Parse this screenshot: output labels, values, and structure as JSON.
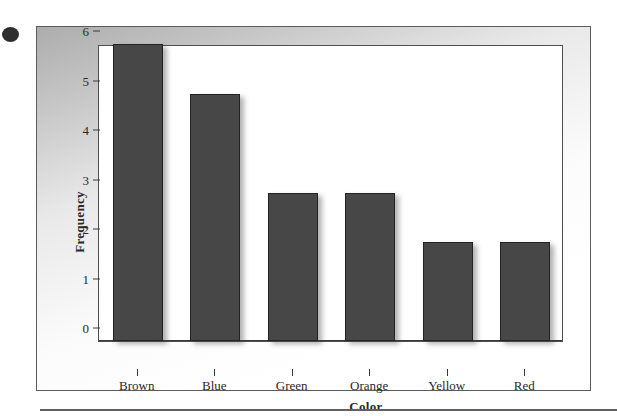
{
  "artifacts": {
    "scan_dot": "scan-dot-artifact",
    "bottom_rule": "horizontal-rule"
  },
  "colors": {
    "bar_fill": "#474747",
    "bar_outline": "#232323",
    "axis": "#3a3a3a",
    "text": "#2a2a2a",
    "panel_gray": "#a8a8a8",
    "canvas": "#ffffff"
  },
  "chart_data": {
    "type": "bar",
    "title": "",
    "xlabel": "Color",
    "ylabel": "Frequency",
    "categories": [
      "Brown",
      "Blue",
      "Green",
      "Orange",
      "Yellow",
      "Red"
    ],
    "values": [
      6,
      5,
      3,
      3,
      2,
      2
    ],
    "ylim": [
      0,
      6
    ],
    "yticks": [
      0,
      1,
      2,
      3,
      4,
      5,
      6
    ],
    "ytick_labels": [
      "0",
      "1",
      "2",
      "3",
      "4",
      "5",
      "6"
    ],
    "grid": false,
    "legend": false,
    "legend_position": "none",
    "bar_color": "#474747",
    "series": [
      {
        "name": "Frequency",
        "values": [
          6,
          5,
          3,
          3,
          2,
          2
        ]
      }
    ],
    "points": [
      {
        "category": "Brown",
        "value": 6
      },
      {
        "category": "Blue",
        "value": 5
      },
      {
        "category": "Green",
        "value": 3
      },
      {
        "category": "Orange",
        "value": 3
      },
      {
        "category": "Yellow",
        "value": 2
      },
      {
        "category": "Red",
        "value": 2
      }
    ]
  }
}
